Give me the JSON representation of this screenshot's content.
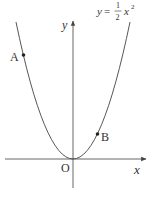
{
  "diagram": {
    "type": "function-graph",
    "equation": {
      "lhs": "y",
      "equals": "=",
      "numerator": "1",
      "denominator": "2",
      "var": "x",
      "exponent": "2",
      "full_text": "y = 1/2 x^2"
    },
    "axes": {
      "x_label": "x",
      "y_label": "y",
      "origin_label": "O"
    },
    "points": [
      {
        "label": "A",
        "position": "left branch"
      },
      {
        "label": "B",
        "position": "right branch"
      }
    ],
    "colors": {
      "stroke": "#444444",
      "text": "#333333",
      "background": "#ffffff"
    }
  }
}
